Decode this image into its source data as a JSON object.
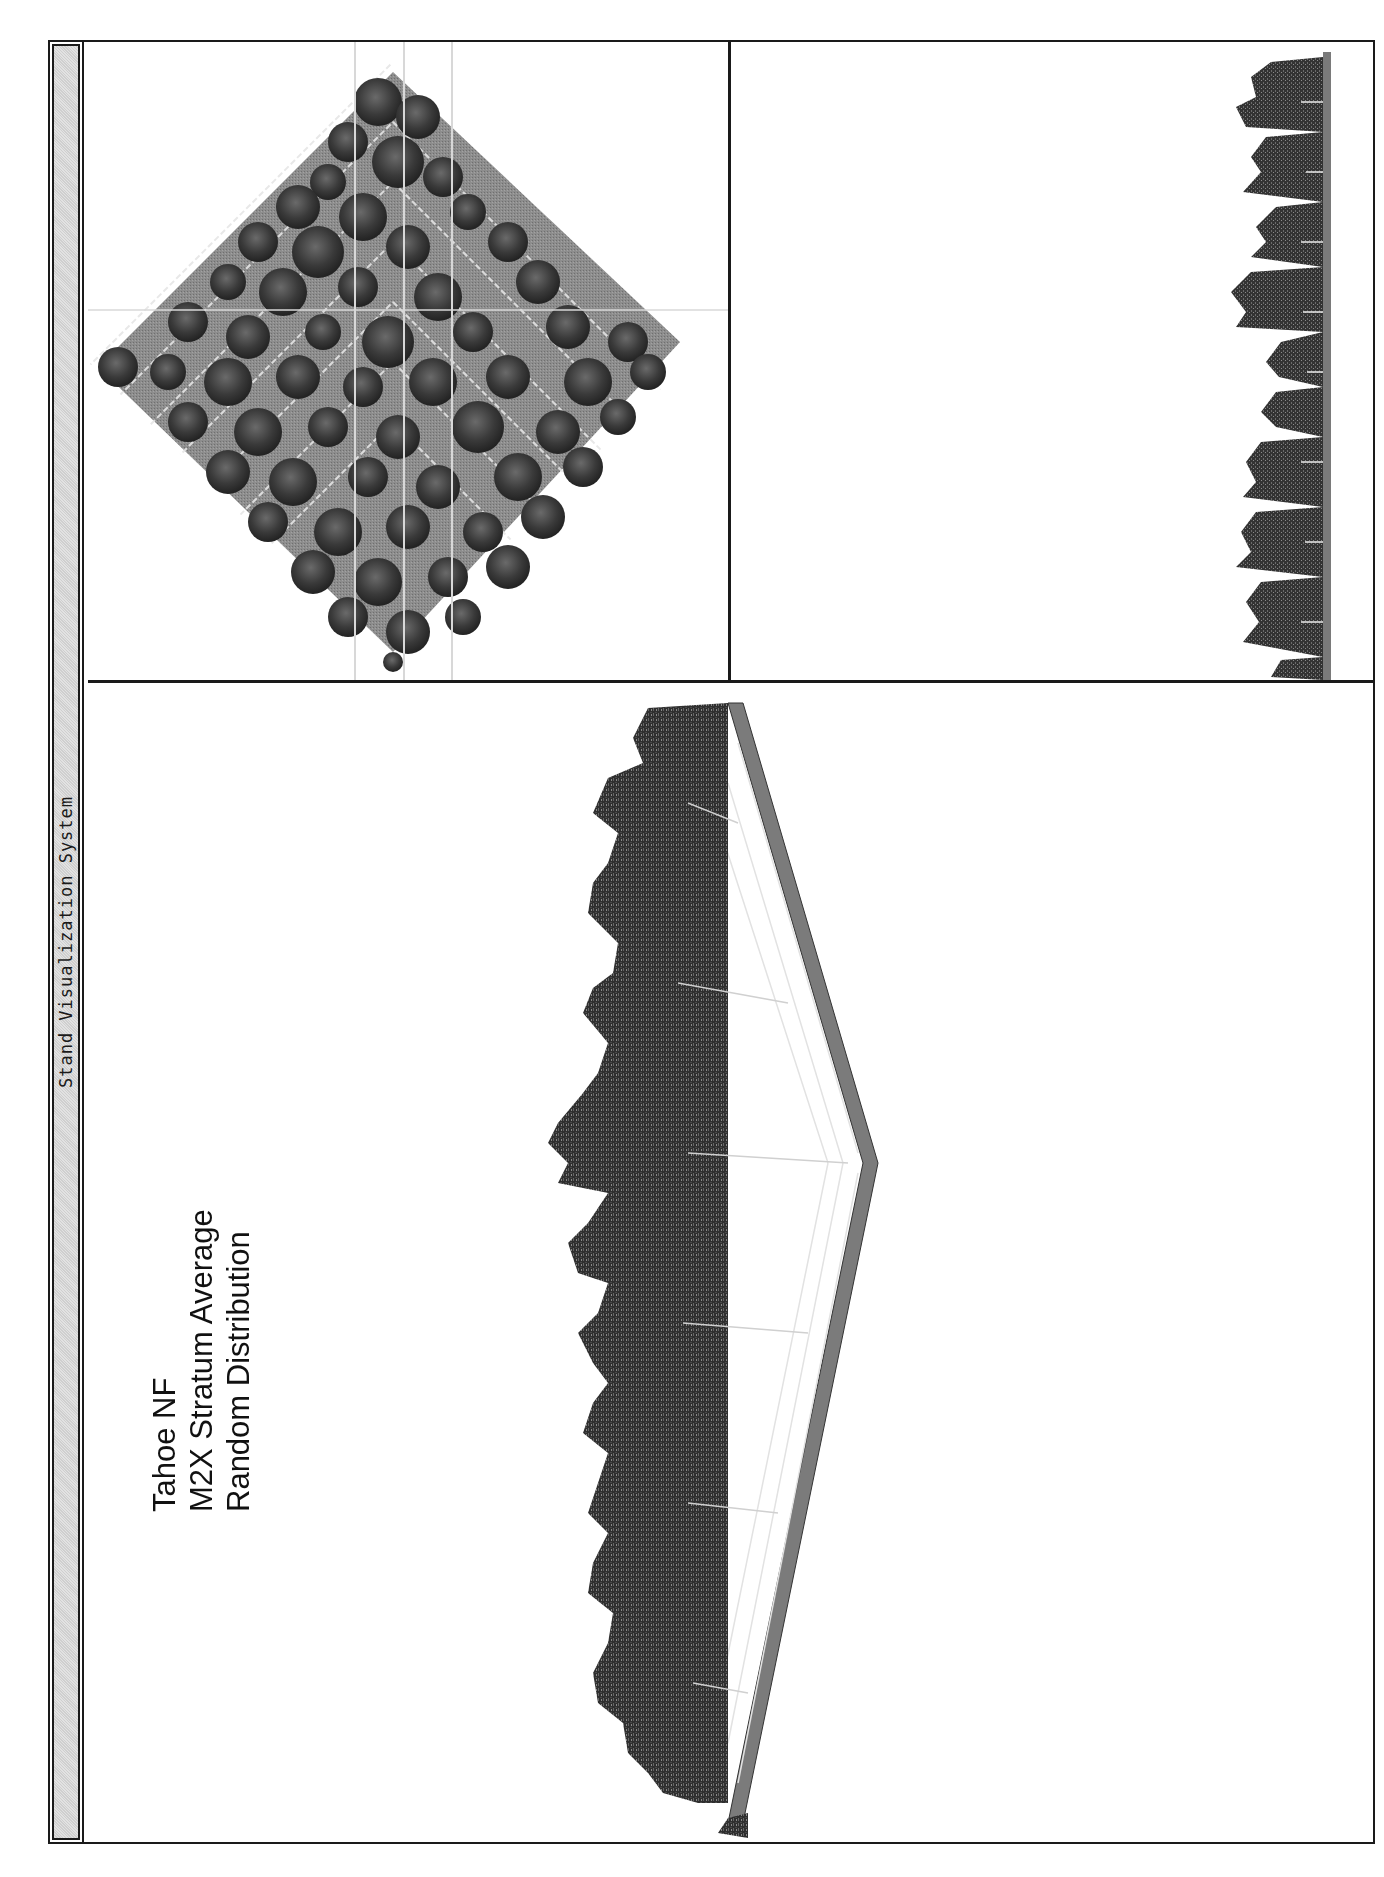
{
  "window": {
    "title": "Stand Visualization System",
    "orientation": "rotated -90deg (page scanned sideways)"
  },
  "stand_labels": {
    "line1": "Tahoe NF",
    "line2": "M2X Stratum Average",
    "line3": "Random Distribution"
  },
  "panels": {
    "overhead": {
      "name": "overhead-plan-view",
      "description": "Diamond-shaped plot with grid and tree crowns seen from above"
    },
    "profile": {
      "name": "side-profile-view",
      "description": "Narrow side profile strip of trees"
    },
    "perspective": {
      "name": "perspective-view",
      "description": "Oblique 3D view of stand on gridded ground plane"
    }
  },
  "colors": {
    "frame": "#1a1a1a",
    "titlebar_bg": "#d8d8d8",
    "ground": "#8a8a8a",
    "grid_lines": "#e8e8e8",
    "tree_dark": "#2e2e2e",
    "tree_mid": "#555555",
    "tree_light": "#7a7a7a"
  }
}
